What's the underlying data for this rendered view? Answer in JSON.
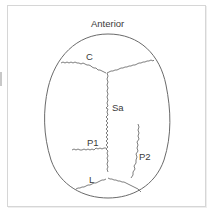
{
  "diagram": {
    "orientation_label": "Anterior",
    "labels": {
      "coronal": "C",
      "sagittal": "Sa",
      "parietal_1": "P1",
      "parietal_2": "P2",
      "lambdoid": "L"
    },
    "colors": {
      "outline": "#6a6a6a",
      "suture": "#6f6f6f",
      "text": "#3a3a3a",
      "frame": "#d6d6d6",
      "background": "#ffffff"
    }
  }
}
